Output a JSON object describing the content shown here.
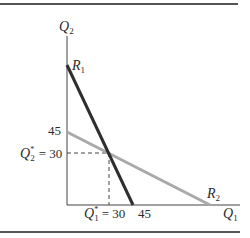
{
  "diagram": {
    "type": "reaction-curves",
    "axes": {
      "y_label": "Q",
      "y_label_sub": "2",
      "x_label": "Q",
      "x_label_sub": "1"
    },
    "curves": [
      {
        "name": "R",
        "sub": "1",
        "color": "#2e2e2e",
        "from": [
          0,
          "top"
        ],
        "to": [
          45,
          0
        ]
      },
      {
        "name": "R",
        "sub": "2",
        "color": "#a9a9a9",
        "from": [
          0,
          45
        ],
        "to": [
          "right",
          0
        ]
      }
    ],
    "ticks": {
      "y_45": "45",
      "x_45": "45"
    },
    "equilibrium": {
      "q2_label": "Q",
      "q2_sub": "2",
      "q2_star": "*",
      "q2_value": "= 30",
      "q1_label": "Q",
      "q1_sub": "1",
      "q1_star": "*",
      "q1_value": "= 30"
    },
    "colors": {
      "frame_rule": "#555555",
      "axis": "#444444",
      "r1": "#2e2e2e",
      "r2": "#a9a9a9",
      "dash": "#444444"
    }
  }
}
